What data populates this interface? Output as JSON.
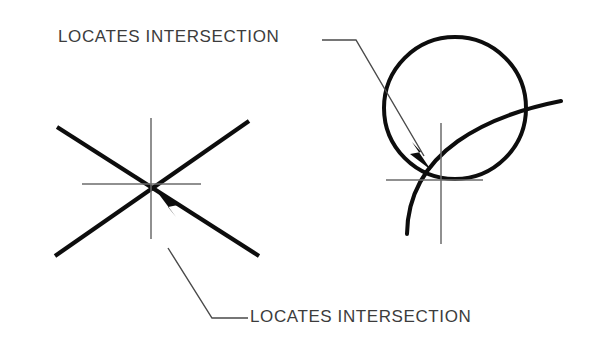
{
  "canvas": {
    "width": 592,
    "height": 364,
    "background": "#ffffff"
  },
  "style": {
    "thick_stroke_color": "#0d0d0d",
    "crosshair_stroke_color": "#6b6b6b",
    "leader_stroke_color": "#4a4a4a",
    "text_color": "#3c3c3c"
  },
  "annotations": {
    "top_label": "LOCATES  INTERSECTION",
    "bottom_label": "LOCATES  INTERSECTION"
  },
  "figures": {
    "left": {
      "name": "two-intersecting-straight-lines",
      "intersection_point": [
        155,
        187
      ],
      "lines": [
        {
          "from": [
            57,
            127
          ],
          "to": [
            259,
            256
          ]
        },
        {
          "from": [
            55,
            256
          ],
          "to": [
            249,
            121
          ]
        }
      ],
      "crosshair": {
        "center": [
          151,
          184
        ],
        "vertical_from": [
          151,
          118
        ],
        "vertical_to": [
          151,
          239
        ],
        "horizontal_from": [
          82,
          184
        ],
        "horizontal_to": [
          201,
          184
        ]
      }
    },
    "right": {
      "name": "circle-and-arc-intersection",
      "intersection_point": [
        430,
        172
      ],
      "circle": {
        "center": [
          455,
          108
        ],
        "radius": 71
      },
      "arc": {
        "from": [
          407,
          234
        ],
        "to": [
          561,
          101
        ],
        "control_1": [
          408,
          150
        ],
        "control_2": [
          490,
          115
        ]
      },
      "crosshair": {
        "center": [
          441,
          180
        ],
        "vertical_from": [
          441,
          123
        ],
        "vertical_to": [
          441,
          244
        ],
        "horizontal_from": [
          386,
          180
        ],
        "horizontal_to": [
          483,
          180
        ]
      }
    }
  },
  "leaders": {
    "top": {
      "points": "322,40 356,40 424,156",
      "arrow_tip": [
        431,
        170
      ],
      "arrow_polygon": "431,170 412,142 421,152 410,154"
    },
    "bottom": {
      "points": "248,318 212,318 168,248",
      "arrow_tip": [
        155,
        189
      ],
      "arrow_polygon": "155,189 176,217 168,207 178,205"
    }
  }
}
